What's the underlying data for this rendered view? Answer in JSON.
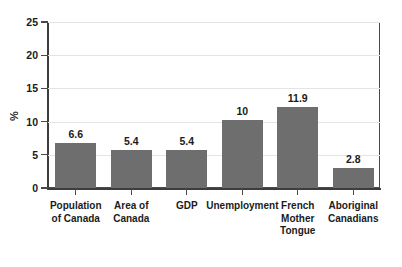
{
  "chart_data": {
    "type": "bar",
    "title": "",
    "xlabel": "",
    "ylabel": "%",
    "ylim": [
      0,
      25
    ],
    "yticks": [
      0,
      5,
      10,
      15,
      20,
      25
    ],
    "grid": true,
    "legend": "none",
    "bar_color": "#6e6e6e",
    "categories": [
      "Population\nof Canada",
      "Area of\nCanada",
      "GDP",
      "Unemployment",
      "French\nMother\nTongue",
      "Aboriginal\nCanadians"
    ],
    "values": [
      6.6,
      5.4,
      5.4,
      10,
      11.9,
      2.8
    ],
    "value_labels": [
      "6.6",
      "5.4",
      "5.4",
      "10",
      "11.9",
      "2.8"
    ]
  },
  "axis": {
    "y_title": "%",
    "tick_labels": [
      "25",
      "20",
      "15",
      "10",
      "5",
      "0"
    ]
  }
}
